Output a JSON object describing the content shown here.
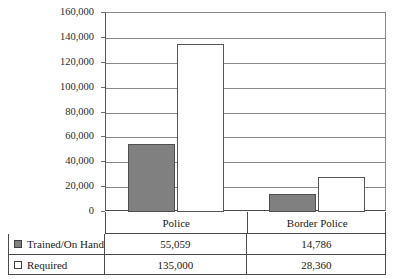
{
  "chart_data": {
    "type": "bar",
    "title": "",
    "xlabel": "",
    "ylabel": "",
    "categories": [
      "Police",
      "Border Police"
    ],
    "series": [
      {
        "name": "Trained/On Hand",
        "values": [
          55059,
          135000
        ]
      },
      {
        "name": "Required",
        "values": [
          14786,
          28360
        ]
      }
    ],
    "table": {
      "rows": [
        {
          "label": "Trained/On Hand",
          "swatch": "filled-gray-square",
          "values": [
            "55,059",
            "14,786"
          ]
        },
        {
          "label": "Required",
          "swatch": "hollow-white-square",
          "values": [
            "135,000",
            "28,360"
          ]
        }
      ]
    },
    "plotted_series": [
      {
        "name": "Trained/On Hand",
        "swatch": "filled-gray-square",
        "values": [
          55059,
          14786
        ],
        "value_labels": [
          "55,059",
          "14,786"
        ]
      },
      {
        "name": "Required",
        "swatch": "hollow-white-square",
        "values": [
          135000,
          28360
        ],
        "value_labels": [
          "135,000",
          "28,360"
        ]
      }
    ],
    "ylim": [
      0,
      160000
    ],
    "ytick_step": 20000,
    "ytick_labels": [
      "160,000",
      "140,000",
      "120,000",
      "100,000",
      "80,000",
      "60,000",
      "40,000",
      "20,000",
      "0"
    ],
    "ytick_values": [
      160000,
      140000,
      120000,
      100000,
      80000,
      60000,
      40000,
      20000,
      0
    ],
    "grid": true,
    "legend_position": "bottom-table",
    "colors": {
      "series_trained": "#808080",
      "series_required": "#ffffff",
      "gridline": "#8a8a8a",
      "axis": "#4a4a4a",
      "background": "#ffffff",
      "text": "#1a1a1a"
    }
  }
}
